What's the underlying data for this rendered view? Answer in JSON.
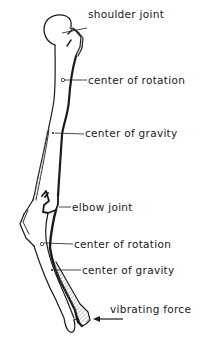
{
  "diagram": {
    "line_color": "#1a1a1a",
    "hatch_color": "#8a8a8a",
    "background": "#ffffff",
    "labels": [
      {
        "id": "shoulder-joint",
        "text": "shoulder joint",
        "x": 88,
        "y": 14
      },
      {
        "id": "center-of-rotation-upper",
        "text": "center of rotation",
        "x": 88,
        "y": 74
      },
      {
        "id": "center-of-gravity-upper",
        "text": "center of gravity",
        "x": 85,
        "y": 127
      },
      {
        "id": "elbow-joint",
        "text": "elbow joint",
        "x": 72,
        "y": 199
      },
      {
        "id": "center-of-rotation-lower",
        "text": "center of rotation",
        "x": 74,
        "y": 238
      },
      {
        "id": "center-of-gravity-lower",
        "text": "center of gravity",
        "x": 82,
        "y": 263
      },
      {
        "id": "vibrating-force",
        "text": "vibrating force",
        "x": 110,
        "y": 303
      }
    ],
    "markers": [
      {
        "id": "upper-rotation-center",
        "type": "circle",
        "x": 63,
        "y": 80
      },
      {
        "id": "upper-gravity-center",
        "type": "cross",
        "x": 53,
        "y": 133
      },
      {
        "id": "lower-rotation-center",
        "type": "circle",
        "x": 42,
        "y": 244
      },
      {
        "id": "lower-gravity-center",
        "type": "cross",
        "x": 52,
        "y": 270
      }
    ],
    "force_arrow": {
      "from_x": 123,
      "to_x": 94,
      "y": 319
    }
  }
}
